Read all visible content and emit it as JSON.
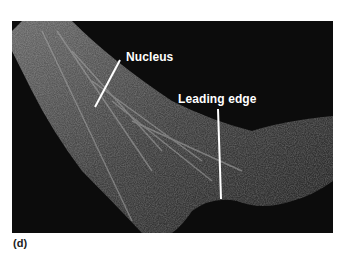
{
  "figure": {
    "panel_label": "(d)",
    "annotations": [
      {
        "text": "Nucleus"
      },
      {
        "text": "Leading edge"
      }
    ],
    "colors": {
      "background": "#0c0c0c",
      "cell": "#8a8a8a",
      "label": "#ffffff",
      "page": "#ffffff"
    }
  }
}
